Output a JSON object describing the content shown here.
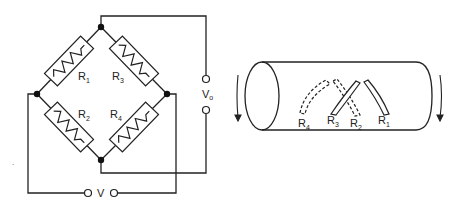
{
  "bridge": {
    "resistors": [
      {
        "name": "R",
        "sub": "1"
      },
      {
        "name": "R",
        "sub": "3"
      },
      {
        "name": "R",
        "sub": "2"
      },
      {
        "name": "R",
        "sub": "4"
      }
    ],
    "output_label": {
      "name": "V",
      "sub": "o"
    },
    "input_label": {
      "name": "V"
    }
  },
  "shaft": {
    "gauges": [
      {
        "name": "R",
        "sub": "4"
      },
      {
        "name": "R",
        "sub": "3"
      },
      {
        "name": "R",
        "sub": "2"
      },
      {
        "name": "R",
        "sub": "1"
      }
    ]
  },
  "colors": {
    "line": "#222222",
    "background": "#ffffff"
  }
}
